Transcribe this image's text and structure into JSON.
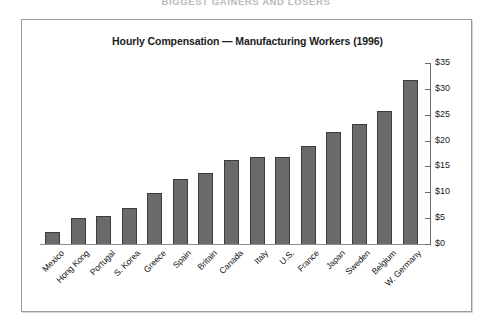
{
  "page_header": "BIGGEST GAINERS AND LOSERS",
  "chart_data": {
    "type": "bar",
    "title": "Hourly Compensation — Manufacturing Workers (1996)",
    "xlabel": "",
    "ylabel": "",
    "ylim": [
      0,
      35
    ],
    "y_tick_step": 5,
    "y_axis_position": "right",
    "grid": false,
    "legend": null,
    "value_prefix": "$",
    "bar_color": "#6a6a6a",
    "bar_border_color": "#3c3c3c",
    "y_ticks": [
      "$0",
      "$5",
      "$10",
      "$15",
      "$20",
      "$25",
      "$30",
      "$35"
    ],
    "categories": [
      "Mexico",
      "Hong Kong",
      "Portugal",
      "S. Korea",
      "Greece",
      "Spain",
      "Britain",
      "Canada",
      "Italy",
      "U.S.",
      "France",
      "Japan",
      "Sweden",
      "Belgium",
      "W. Germany"
    ],
    "values": [
      2.6,
      5.2,
      5.6,
      7.2,
      10.1,
      12.8,
      14.1,
      16.6,
      17.2,
      17.2,
      19.3,
      22.0,
      23.6,
      26.1,
      32.0
    ]
  }
}
